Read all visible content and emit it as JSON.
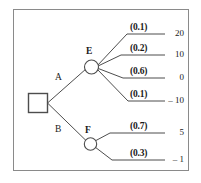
{
  "diagram": {
    "decision_node": {
      "shape": "square",
      "label": ""
    },
    "branches": [
      {
        "label": "A",
        "to": "E"
      },
      {
        "label": "B",
        "to": "F"
      }
    ],
    "chance_nodes": [
      {
        "id": "E",
        "label": "E",
        "outcomes": [
          {
            "probability": "(0.1)",
            "payoff": "20"
          },
          {
            "probability": "(0.2)",
            "payoff": "10"
          },
          {
            "probability": "(0.6)",
            "payoff": "0"
          },
          {
            "probability": "(0.1)",
            "payoff": "– 10"
          }
        ]
      },
      {
        "id": "F",
        "label": "F",
        "outcomes": [
          {
            "probability": "(0.7)",
            "payoff": "5"
          },
          {
            "probability": "(0.3)",
            "payoff": "– 1"
          }
        ]
      }
    ],
    "colors": {
      "line": "#4d4d4d",
      "frame": "#8a8a8a",
      "text": "#1a1a1a",
      "background": "#ffffff"
    }
  }
}
